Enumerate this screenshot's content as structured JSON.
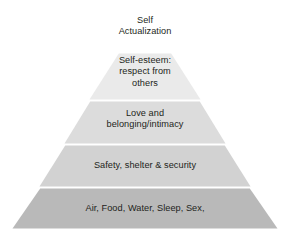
{
  "diagram": {
    "type": "pyramid",
    "name": "maslow-hierarchy-of-needs",
    "background_color": "#ffffff",
    "text_color": "#231f20",
    "divider_color": "#ffffff",
    "tier_count": 5,
    "tiers": [
      {
        "index": 1,
        "position": "apex",
        "label": "Self\nActualization",
        "fill": "#ffffff"
      },
      {
        "index": 2,
        "label": "Self-esteem:\nrespect from\nothers",
        "fill": "#eaeaea"
      },
      {
        "index": 3,
        "label": "Love and\nbelonging/intimacy",
        "fill": "#dcdcdc"
      },
      {
        "index": 4,
        "label": "Safety, shelter & security",
        "fill": "#d2d2d2"
      },
      {
        "index": 5,
        "position": "base",
        "label": "Air, Food, Water, Sleep, Sex,",
        "fill": "#b9b9b9"
      }
    ]
  }
}
